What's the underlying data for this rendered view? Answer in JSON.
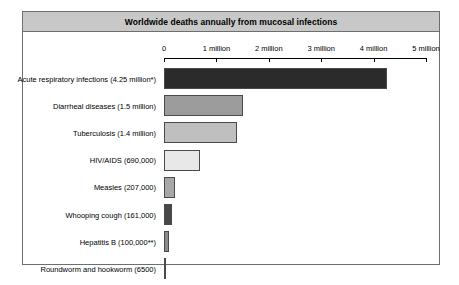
{
  "chart": {
    "title": "Worldwide deaths annually from mucosal infections"
  },
  "chart_data": {
    "type": "bar",
    "orientation": "horizontal",
    "title": "Worldwide deaths annually from mucosal infections",
    "xlabel": "",
    "ylabel": "",
    "xlim": [
      0,
      5000000
    ],
    "grid": false,
    "legend": null,
    "axis": {
      "tick_values": [
        0,
        1000000,
        2000000,
        3000000,
        4000000,
        5000000
      ],
      "tick_labels": [
        "0",
        "1 million",
        "2 million",
        "3 million",
        "4 million",
        "5 million"
      ]
    },
    "categories": [
      "Acute respiratory infections (4.25 million*)",
      "Diarrheal diseases (1.5 million)",
      "Tuberculosis (1.4 million)",
      "HIV/AIDS (690,000)",
      "Measles (207,000)",
      "Whooping cough (161,000)",
      "Hepatitis B (100,000**)",
      "Roundworm and hookworm (6500)"
    ],
    "values": [
      4250000,
      1500000,
      1400000,
      690000,
      207000,
      161000,
      100000,
      6500
    ],
    "bar_colors": [
      "#2b2b2b",
      "#9c9c9c",
      "#bfbfbf",
      "#e8e8e8",
      "#a8a8a8",
      "#474747",
      "#8a8a8a",
      "#1a1a1a"
    ]
  },
  "colors": {
    "title_bar": "#c8c8c8",
    "frame_border": "#6e6e6e",
    "bar_border": "#4a4a4a",
    "background": "#ffffff"
  }
}
